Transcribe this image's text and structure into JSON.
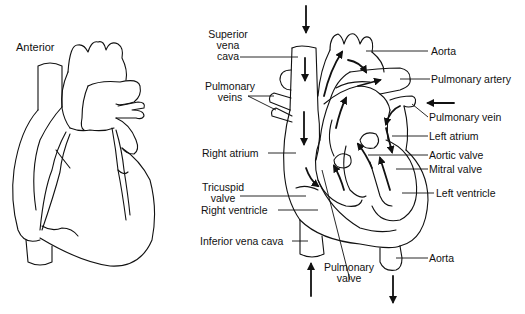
{
  "figure": {
    "left_panel": {
      "title": "Anterior",
      "description": "External anterior view of the heart (line drawing)"
    },
    "right_panel": {
      "description": "Internal cross-section of the heart showing blood flow with arrows",
      "labels": {
        "superior_vena_cava": [
          "Superior",
          "vena",
          "cava"
        ],
        "pulmonary_veins": [
          "Pulmonary",
          "veins"
        ],
        "right_atrium": "Right  atrium",
        "tricuspid_valve": [
          "Tricuspid",
          "valve"
        ],
        "right_ventricle": "Right  ventricle",
        "inferior_vena_cava": "Inferior vena cava",
        "pulmonary_valve": [
          "Pulmonary",
          "valve"
        ],
        "aorta_top": "Aorta",
        "pulmonary_artery": "Pulmonary artery",
        "pulmonary_vein": "Pulmonary vein",
        "left_atrium": "Left atrium",
        "aortic_valve": "Aortic valve",
        "mitral_valve": "Mitral valve",
        "left_ventricle": "Left ventricle",
        "aorta_bottom": "Aorta"
      }
    },
    "colors": {
      "line": "#111111",
      "background": "#ffffff"
    }
  }
}
